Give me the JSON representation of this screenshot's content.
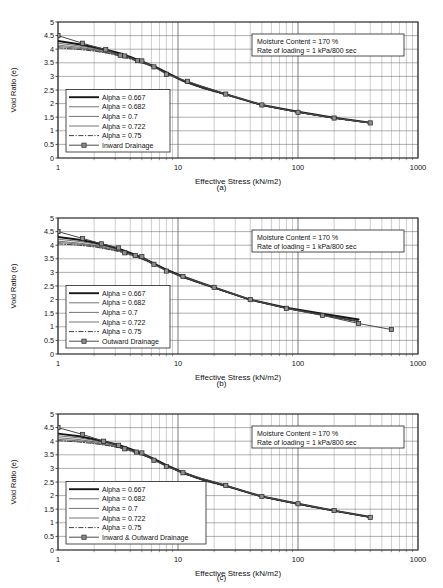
{
  "figure": {
    "panels": [
      {
        "id": "a",
        "sub_label": "(a)",
        "annotation": {
          "line1": "Moisture Content = 170 %",
          "line2": "Rate of loading = 1 kPa/800 sec"
        },
        "chart_data": {
          "type": "line",
          "title": "",
          "xlabel": "Effective Stress (kN/m2)",
          "ylabel": "Void Ratio (e)",
          "xscale": "log",
          "xlim": [
            1,
            1000
          ],
          "ylim": [
            0,
            5
          ],
          "yticks": [
            0,
            0.5,
            1,
            1.5,
            2,
            2.5,
            3,
            3.5,
            4,
            4.5,
            5
          ],
          "xticks": [
            1,
            10,
            100,
            1000
          ],
          "grid": true,
          "legend_position": "lower-left",
          "series": [
            {
              "name": "Alpha = 0.667",
              "style": "solid-thick",
              "x": [
                1,
                1.5,
                2,
                2.6,
                3.2,
                4,
                5,
                6.5,
                8,
                11,
                16,
                25,
                50,
                100,
                200,
                400
              ],
              "y": [
                4.3,
                4.18,
                4.07,
                3.96,
                3.86,
                3.72,
                3.55,
                3.35,
                3.15,
                2.85,
                2.6,
                2.35,
                1.95,
                1.7,
                1.48,
                1.3
              ]
            },
            {
              "name": "Alpha = 0.682",
              "style": "solid-thin",
              "x": [
                1,
                1.5,
                2,
                2.6,
                3.2,
                4,
                5,
                6.5,
                8,
                11,
                16,
                25,
                50,
                100,
                200,
                400
              ],
              "y": [
                4.22,
                4.12,
                4.03,
                3.93,
                3.82,
                3.7,
                3.54,
                3.34,
                3.14,
                2.84,
                2.59,
                2.34,
                1.95,
                1.69,
                1.47,
                1.29
              ]
            },
            {
              "name": "Alpha = 0.7",
              "style": "solid-thin",
              "x": [
                1,
                1.5,
                2,
                2.6,
                3.2,
                4,
                5,
                6.5,
                8,
                11,
                16,
                25,
                50,
                100,
                200,
                400
              ],
              "y": [
                4.15,
                4.07,
                3.99,
                3.9,
                3.8,
                3.68,
                3.53,
                3.33,
                3.13,
                2.83,
                2.58,
                2.33,
                1.94,
                1.69,
                1.47,
                1.29
              ]
            },
            {
              "name": "Alpha = 0.722",
              "style": "solid-thin",
              "x": [
                1,
                1.5,
                2,
                2.6,
                3.2,
                4,
                5,
                6.5,
                8,
                11,
                16,
                25,
                50,
                100,
                200,
                400
              ],
              "y": [
                4.1,
                4.03,
                3.96,
                3.87,
                3.78,
                3.66,
                3.52,
                3.32,
                3.12,
                2.82,
                2.57,
                2.33,
                1.94,
                1.68,
                1.46,
                1.28
              ]
            },
            {
              "name": "Alpha = 0.75",
              "style": "dash-dot",
              "x": [
                1,
                1.5,
                2,
                2.6,
                3.2,
                4,
                5,
                6.5,
                8,
                11,
                16,
                25,
                50,
                100,
                200,
                400
              ],
              "y": [
                4.05,
                3.99,
                3.93,
                3.85,
                3.76,
                3.64,
                3.5,
                3.31,
                3.11,
                2.81,
                2.56,
                2.32,
                1.93,
                1.68,
                1.46,
                1.28
              ]
            },
            {
              "name": "Inward Drainage",
              "style": "marker-square",
              "x": [
                1,
                1.6,
                2.5,
                3.3,
                3.6,
                4.6,
                5,
                6.3,
                8,
                12,
                25,
                50,
                100,
                200,
                400
              ],
              "y": [
                4.5,
                4.22,
                3.98,
                3.78,
                3.75,
                3.58,
                3.57,
                3.35,
                3.08,
                2.82,
                2.35,
                1.95,
                1.68,
                1.47,
                1.29
              ]
            }
          ]
        }
      },
      {
        "id": "b",
        "sub_label": "(b)",
        "annotation": {
          "line1": "Moisture Content = 170 %",
          "line2": "Rate of loading = 1 kPa/800 sec"
        },
        "chart_data": {
          "type": "line",
          "title": "",
          "xlabel": "Effective Stress (kN/m2)",
          "ylabel": "Void Ratio (e)",
          "xscale": "log",
          "xlim": [
            1,
            1000
          ],
          "ylim": [
            0,
            5
          ],
          "yticks": [
            0,
            0.5,
            1,
            1.5,
            2,
            2.5,
            3,
            3.5,
            4,
            4.5,
            5
          ],
          "xticks": [
            1,
            10,
            100,
            1000
          ],
          "grid": true,
          "legend_position": "lower-left",
          "series": [
            {
              "name": "Alpha = 0.667",
              "style": "solid-thick",
              "x": [
                1,
                1.5,
                2,
                2.6,
                3.2,
                4,
                5,
                6.5,
                8,
                11,
                16,
                20,
                40,
                80,
                160,
                320
              ],
              "y": [
                4.3,
                4.2,
                4.1,
                3.98,
                3.87,
                3.72,
                3.55,
                3.3,
                3.1,
                2.85,
                2.6,
                2.45,
                2.0,
                1.7,
                1.48,
                1.27
              ]
            },
            {
              "name": "Alpha = 0.682",
              "style": "solid-thin",
              "x": [
                1,
                1.5,
                2,
                2.6,
                3.2,
                4,
                5,
                6.5,
                8,
                11,
                16,
                20,
                40,
                80,
                160,
                320
              ],
              "y": [
                4.22,
                4.14,
                4.05,
                3.94,
                3.84,
                3.7,
                3.54,
                3.29,
                3.09,
                2.84,
                2.59,
                2.44,
                2.0,
                1.69,
                1.45,
                1.22
              ]
            },
            {
              "name": "Alpha = 0.7",
              "style": "solid-thin",
              "x": [
                1,
                1.5,
                2,
                2.6,
                3.2,
                4,
                5,
                6.5,
                8,
                11,
                16,
                20,
                40,
                80,
                160,
                320
              ],
              "y": [
                4.15,
                4.08,
                4.0,
                3.9,
                3.81,
                3.68,
                3.52,
                3.28,
                3.08,
                2.83,
                2.58,
                2.43,
                1.99,
                1.68,
                1.44,
                1.2
              ]
            },
            {
              "name": "Alpha = 0.722",
              "style": "solid-thin",
              "x": [
                1,
                1.5,
                2,
                2.6,
                3.2,
                4,
                5,
                6.5,
                8,
                11,
                16,
                20,
                40,
                80,
                160,
                320
              ],
              "y": [
                4.1,
                4.04,
                3.97,
                3.87,
                3.79,
                3.66,
                3.5,
                3.27,
                3.07,
                2.82,
                2.57,
                2.43,
                1.99,
                1.68,
                1.43,
                1.19
              ]
            },
            {
              "name": "Alpha = 0.75",
              "style": "dash-dot",
              "x": [
                1,
                1.5,
                2,
                2.6,
                3.2,
                4,
                5,
                6.5,
                8,
                11,
                16,
                20,
                40,
                80,
                160,
                320
              ],
              "y": [
                4.05,
                4.0,
                3.94,
                3.85,
                3.77,
                3.64,
                3.49,
                3.26,
                3.06,
                2.81,
                2.56,
                2.42,
                1.98,
                1.67,
                1.42,
                1.18
              ]
            },
            {
              "name": "Outward Drainage",
              "style": "marker-square",
              "x": [
                1,
                1.6,
                2.3,
                3.2,
                3.6,
                4.4,
                5,
                6.3,
                8,
                11,
                20,
                40,
                80,
                160,
                320,
                600
              ],
              "y": [
                4.5,
                4.25,
                4.05,
                3.9,
                3.72,
                3.62,
                3.58,
                3.3,
                3.05,
                2.85,
                2.45,
                2.0,
                1.68,
                1.42,
                1.12,
                0.9
              ]
            }
          ]
        }
      },
      {
        "id": "c",
        "sub_label": "(c)",
        "annotation": {
          "line1": "Moisture Content = 170 %",
          "line2": "Rate of loading = 1 kPa/800 sec"
        },
        "chart_data": {
          "type": "line",
          "title": "",
          "xlabel": "Effective Stress (kN/m2)",
          "ylabel": "Void Ratio (e)",
          "xscale": "log",
          "xlim": [
            1,
            1000
          ],
          "ylim": [
            0,
            5
          ],
          "yticks": [
            0,
            0.5,
            1,
            1.5,
            2,
            2.5,
            3,
            3.5,
            4,
            4.5,
            5
          ],
          "xticks": [
            1,
            10,
            100,
            1000
          ],
          "grid": true,
          "legend_position": "lower-left",
          "series": [
            {
              "name": "Alpha = 0.667",
              "style": "solid-thick",
              "x": [
                1,
                1.5,
                2,
                2.6,
                3.2,
                4,
                5,
                6.5,
                8,
                11,
                16,
                25,
                50,
                100,
                200,
                400
              ],
              "y": [
                4.28,
                4.18,
                4.07,
                3.96,
                3.86,
                3.72,
                3.55,
                3.32,
                3.12,
                2.85,
                2.6,
                2.37,
                1.97,
                1.7,
                1.45,
                1.22
              ]
            },
            {
              "name": "Alpha = 0.682",
              "style": "solid-thin",
              "x": [
                1,
                1.5,
                2,
                2.6,
                3.2,
                4,
                5,
                6.5,
                8,
                11,
                16,
                25,
                50,
                100,
                200,
                400
              ],
              "y": [
                4.2,
                4.12,
                4.03,
                3.93,
                3.83,
                3.7,
                3.54,
                3.31,
                3.11,
                2.84,
                2.59,
                2.36,
                1.96,
                1.69,
                1.44,
                1.21
              ]
            },
            {
              "name": "Alpha = 0.7",
              "style": "solid-thin",
              "x": [
                1,
                1.5,
                2,
                2.6,
                3.2,
                4,
                5,
                6.5,
                8,
                11,
                16,
                25,
                50,
                100,
                200,
                400
              ],
              "y": [
                4.13,
                4.06,
                3.98,
                3.89,
                3.8,
                3.68,
                3.53,
                3.3,
                3.1,
                2.83,
                2.58,
                2.35,
                1.96,
                1.69,
                1.44,
                1.2
              ]
            },
            {
              "name": "Alpha = 0.722",
              "style": "solid-thin",
              "x": [
                1,
                1.5,
                2,
                2.6,
                3.2,
                4,
                5,
                6.5,
                8,
                11,
                16,
                25,
                50,
                100,
                200,
                400
              ],
              "y": [
                4.07,
                4.01,
                3.94,
                3.86,
                3.78,
                3.66,
                3.51,
                3.29,
                3.09,
                2.82,
                2.57,
                2.35,
                1.95,
                1.68,
                1.43,
                1.2
              ]
            },
            {
              "name": "Alpha = 0.75",
              "style": "dash-dot",
              "x": [
                1,
                1.5,
                2,
                2.6,
                3.2,
                4,
                5,
                6.5,
                8,
                11,
                16,
                25,
                50,
                100,
                200,
                400
              ],
              "y": [
                4.02,
                3.97,
                3.91,
                3.84,
                3.76,
                3.64,
                3.5,
                3.28,
                3.08,
                2.81,
                2.56,
                2.34,
                1.95,
                1.68,
                1.43,
                1.19
              ]
            },
            {
              "name": "Inward & Outward Drainage",
              "style": "marker-square",
              "x": [
                1,
                1.6,
                2.4,
                3.2,
                3.6,
                4.5,
                5,
                6.3,
                8,
                11,
                25,
                50,
                100,
                200,
                400
              ],
              "y": [
                4.5,
                4.25,
                4.0,
                3.85,
                3.72,
                3.6,
                3.57,
                3.3,
                3.07,
                2.84,
                2.37,
                1.97,
                1.7,
                1.45,
                1.2
              ]
            }
          ]
        }
      }
    ]
  }
}
